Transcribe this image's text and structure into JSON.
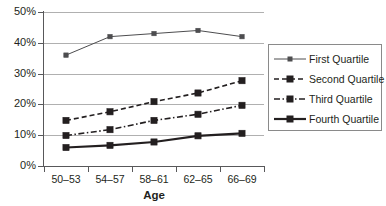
{
  "chart_data": {
    "type": "line",
    "title": "",
    "xlabel": "Age",
    "ylabel": "",
    "categories": [
      "50–53",
      "54–57",
      "58–61",
      "62–65",
      "66–69"
    ],
    "ylim": [
      0,
      50
    ],
    "yticks": [
      0,
      10,
      20,
      30,
      40,
      50
    ],
    "ytick_labels": [
      "0%",
      "10%",
      "20%",
      "30%",
      "40%",
      "50%"
    ],
    "grid": "horizontal",
    "legend_position": "right",
    "series": [
      {
        "name": "First Quartile",
        "values": [
          36,
          42,
          43,
          44,
          42
        ],
        "line_style": "solid",
        "line_width": 1,
        "marker": "square-small",
        "color": "#4d4d4f"
      },
      {
        "name": "Second Quartile",
        "values": [
          14.8,
          17.6,
          20.9,
          23.7,
          27.7
        ],
        "line_style": "dashed",
        "line_width": 1.6,
        "marker": "square",
        "color": "#231f20"
      },
      {
        "name": "Third Quartile",
        "values": [
          9.9,
          11.8,
          14.8,
          16.8,
          19.7
        ],
        "line_style": "dash-dot",
        "line_width": 1.6,
        "marker": "square",
        "color": "#231f20"
      },
      {
        "name": "Fourth Quartile",
        "values": [
          6.0,
          6.7,
          7.8,
          9.8,
          10.6
        ],
        "line_style": "solid",
        "line_width": 2.2,
        "marker": "square",
        "color": "#231f20"
      }
    ]
  },
  "axis": {
    "x_title": "Age"
  },
  "legend": {
    "items": [
      {
        "label": "First Quartile"
      },
      {
        "label": "Second Quartile"
      },
      {
        "label": "Third Quartile"
      },
      {
        "label": "Fourth Quartile"
      }
    ]
  },
  "colors": {
    "axis": "#58585a",
    "grid": "#b0b0b0",
    "ink": "#231f20",
    "series_light": "#4d4d4f",
    "background": "#ffffff"
  }
}
